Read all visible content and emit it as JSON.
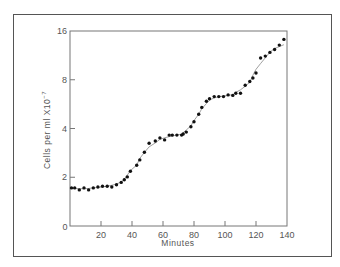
{
  "chart_data": {
    "type": "scatter",
    "title": "",
    "xlabel": "Minutes",
    "ylabel": "Cells per ml X10⁻⁷",
    "x_ticks": [
      0,
      20,
      40,
      60,
      80,
      100,
      120,
      140
    ],
    "y_ticks": [
      {
        "value": 1,
        "label": "0"
      },
      {
        "value": 2,
        "label": "2"
      },
      {
        "value": 4,
        "label": "4"
      },
      {
        "value": 8,
        "label": "8"
      },
      {
        "value": 16,
        "label": "16"
      }
    ],
    "xlim": [
      0,
      140
    ],
    "ylim": [
      1,
      16
    ],
    "y_scale": "log2",
    "grid": false,
    "legend": null,
    "annotations": [],
    "series": [
      {
        "name": "Cells per ml",
        "marker": "filled-circle",
        "smooth_line": true,
        "x": [
          1,
          3,
          6,
          9,
          12,
          15,
          18,
          21,
          24,
          27,
          30,
          33,
          35,
          37,
          39,
          43,
          45,
          48,
          51,
          55,
          58,
          61,
          64,
          66,
          69,
          72,
          73,
          75,
          78,
          80,
          83,
          85,
          88,
          90,
          93,
          96,
          99,
          102,
          105,
          107,
          110,
          113,
          116,
          118,
          120,
          123,
          126,
          129,
          132,
          135,
          138
        ],
        "values": [
          1.72,
          1.72,
          1.67,
          1.72,
          1.67,
          1.72,
          1.74,
          1.76,
          1.76,
          1.74,
          1.8,
          1.86,
          1.93,
          2.01,
          2.18,
          2.37,
          2.56,
          2.85,
          3.24,
          3.35,
          3.5,
          3.4,
          3.64,
          3.64,
          3.64,
          3.64,
          3.7,
          3.8,
          4.1,
          4.4,
          4.9,
          5.4,
          5.9,
          6.1,
          6.3,
          6.3,
          6.3,
          6.45,
          6.4,
          6.6,
          6.6,
          7.4,
          7.8,
          8.2,
          8.8,
          10.9,
          11.2,
          11.8,
          12.3,
          13.1,
          14.2
        ]
      }
    ]
  },
  "axes": {
    "x_title": "Minutes",
    "y_title": "Cells per ml X10",
    "y_title_exp": "−7",
    "x_tick_labels": [
      "0",
      "20",
      "40",
      "60",
      "80",
      "100",
      "120",
      "140"
    ],
    "y_tick_labels": [
      "0",
      "2",
      "4",
      "8",
      "16"
    ]
  },
  "colors": {
    "axis": "#777777",
    "frame": "#555555",
    "marker": "#111111",
    "curve": "#888888"
  }
}
